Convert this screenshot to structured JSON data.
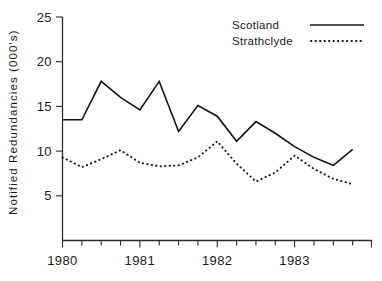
{
  "chart_data": {
    "type": "line",
    "title": "",
    "xlabel": "",
    "ylabel": "Notified Redundancies  (000's)",
    "ylim": [
      0,
      25
    ],
    "xlim": [
      0,
      16
    ],
    "grid": false,
    "legend_position": "top-right",
    "ytick_values": [
      5,
      10,
      15,
      20,
      25
    ],
    "ytick_labels": [
      "5",
      "10",
      "15",
      "20",
      "25"
    ],
    "xtick_labels": [
      "1980",
      "1981",
      "1982",
      "1983"
    ],
    "xtick_positions": [
      0,
      4,
      8,
      12
    ],
    "x_minor_ticks": [
      0,
      1,
      2,
      3,
      4,
      5,
      6,
      7,
      8,
      9,
      10,
      11,
      12,
      13,
      14,
      15
    ],
    "x": [
      0,
      1,
      2,
      3,
      4,
      5,
      6,
      7,
      8,
      9,
      10,
      11,
      12,
      13,
      14,
      15
    ],
    "series": [
      {
        "name": "Scotland",
        "style": "solid",
        "values": [
          13.5,
          13.5,
          17.8,
          16.0,
          14.6,
          17.8,
          12.2,
          15.1,
          13.9,
          11.1,
          13.3,
          12.0,
          10.5,
          9.3,
          8.4,
          10.2
        ]
      },
      {
        "name": "Strathclyde",
        "style": "dotted",
        "values": [
          9.3,
          8.2,
          9.1,
          10.1,
          8.7,
          8.3,
          8.4,
          9.3,
          11.1,
          8.6,
          6.6,
          7.6,
          9.5,
          8.0,
          6.9,
          6.3
        ]
      }
    ]
  },
  "legend": {
    "entries": [
      {
        "label": "Scotland",
        "style": "solid"
      },
      {
        "label": "Strathclyde",
        "style": "dotted"
      }
    ]
  },
  "colors": {
    "ink": "#111111",
    "axis": "#2b2b2b",
    "background": "#ffffff"
  }
}
